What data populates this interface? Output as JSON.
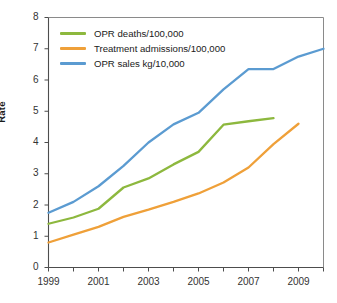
{
  "chart_data": {
    "type": "line",
    "title": "",
    "xlabel": "",
    "ylabel": "Rate",
    "xlim": [
      1999,
      2010
    ],
    "ylim": [
      0,
      8
    ],
    "grid": false,
    "legend_position": "top-left",
    "x_tick_labels": [
      "1999",
      "2001",
      "2003",
      "2005",
      "2007",
      "2009"
    ],
    "x_tick_values": [
      1999,
      2001,
      2003,
      2005,
      2007,
      2009
    ],
    "x_minor_ticks": [
      1999,
      2000,
      2001,
      2002,
      2003,
      2004,
      2005,
      2006,
      2007,
      2008,
      2009,
      2010
    ],
    "y_tick_labels": [
      "0",
      "1",
      "2",
      "3",
      "4",
      "5",
      "6",
      "7",
      "8"
    ],
    "y_tick_values": [
      0,
      1,
      2,
      3,
      4,
      5,
      6,
      7,
      8
    ],
    "series": [
      {
        "name": "OPR deaths/100,000",
        "color": "#8DB83E",
        "x": [
          1999,
          2000,
          2001,
          2002,
          2003,
          2004,
          2005,
          2006,
          2007,
          2008
        ],
        "values": [
          1.4,
          1.6,
          1.88,
          2.56,
          2.85,
          3.3,
          3.7,
          4.57,
          4.68,
          4.78
        ]
      },
      {
        "name": "Treatment admissions/100,000",
        "color": "#EFA039",
        "x": [
          1999,
          2000,
          2001,
          2002,
          2003,
          2004,
          2005,
          2006,
          2007,
          2008,
          2009
        ],
        "values": [
          0.8,
          1.05,
          1.3,
          1.62,
          1.85,
          2.1,
          2.37,
          2.72,
          3.2,
          3.95,
          4.6
        ]
      },
      {
        "name": "OPR sales kg/10,000",
        "color": "#5B9BD1",
        "x": [
          1999,
          2000,
          2001,
          2002,
          2003,
          2004,
          2005,
          2006,
          2007,
          2008,
          2009,
          2010
        ],
        "values": [
          1.75,
          2.1,
          2.6,
          3.25,
          4.0,
          4.58,
          4.95,
          5.7,
          6.35,
          6.35,
          6.75,
          7.0
        ]
      }
    ]
  },
  "legend": {
    "items": [
      {
        "label": "OPR deaths/100,000",
        "color": "#8DB83E"
      },
      {
        "label": "Treatment admissions/100,000",
        "color": "#EFA039"
      },
      {
        "label": "OPR sales kg/10,000",
        "color": "#5B9BD1"
      }
    ]
  },
  "axes": {
    "y_title": "Rate"
  }
}
